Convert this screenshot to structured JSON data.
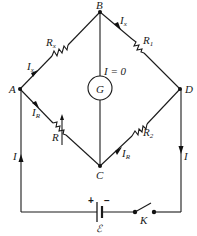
{
  "diagram": {
    "nodes": {
      "A": "A",
      "B": "B",
      "C": "C",
      "D": "D"
    },
    "galvanometer": {
      "label": "G",
      "current_label": "I = 0"
    },
    "resistors": {
      "Rx": {
        "main": "R",
        "sub": "x"
      },
      "R1": {
        "main": "R",
        "sub": "1"
      },
      "R": {
        "main": "R",
        "sub": ""
      },
      "R2": {
        "main": "R",
        "sub": "2"
      }
    },
    "currents": {
      "Ix_AB": {
        "main": "I",
        "sub": "x"
      },
      "Ix_BD": {
        "main": "I",
        "sub": "x"
      },
      "IR_AC": {
        "main": "I",
        "sub": "R"
      },
      "IR_CD": {
        "main": "I",
        "sub": "R"
      },
      "I_left": "I",
      "I_right": "I"
    },
    "battery": {
      "label": "ℰ",
      "plus": "+",
      "minus": "−"
    },
    "switch": {
      "label": "K"
    }
  }
}
